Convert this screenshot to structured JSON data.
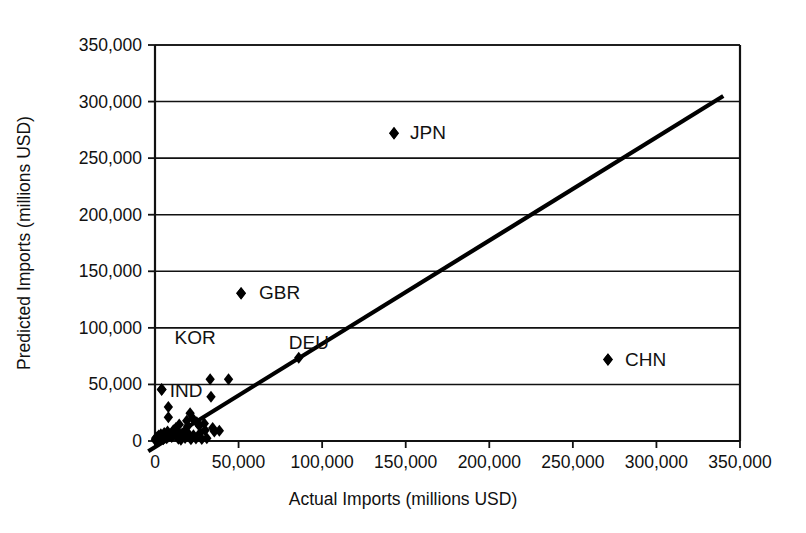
{
  "chart_data": {
    "type": "scatter",
    "title": "",
    "xlabel": "Actual Imports (millions USD)",
    "ylabel": "Predicted Imports (millions USD)",
    "xlim": [
      0,
      350000
    ],
    "ylim": [
      0,
      350000
    ],
    "xticks": [
      0,
      50000,
      100000,
      150000,
      200000,
      250000,
      300000,
      350000
    ],
    "yticks": [
      0,
      50000,
      100000,
      150000,
      200000,
      250000,
      300000,
      350000
    ],
    "xtick_labels": [
      "0",
      "50,000",
      "100,000",
      "150,000",
      "200,000",
      "250,000",
      "300,000",
      "350,000"
    ],
    "ytick_labels": [
      "0",
      "50,000",
      "100,000",
      "150,000",
      "200,000",
      "250,000",
      "300,000",
      "350,000"
    ],
    "grid": "horizontal",
    "legend": "none",
    "marker": "diamond",
    "marker_color": "#000000",
    "line_color": "#000000",
    "reference_line": {
      "name": "identity-line",
      "x": [
        -4000,
        340000
      ],
      "y": [
        -9000,
        305000
      ]
    },
    "annotations": [
      {
        "label": "JPN",
        "x": 143000,
        "y": 272000,
        "marker": true,
        "label_dx": 16,
        "label_dy": 6
      },
      {
        "label": "GBR",
        "x": 51500,
        "y": 130500,
        "marker": true,
        "label_dx": 18,
        "label_dy": 6
      },
      {
        "label": "CHN",
        "x": 271000,
        "y": 72000,
        "marker": true,
        "label_dx": 17,
        "label_dy": 6
      },
      {
        "label": "KOR",
        "x": 36000,
        "y": 86000,
        "marker": false,
        "label_dx": -20,
        "label_dy": 0
      },
      {
        "label": "DEU",
        "x": 104000,
        "y": 81000,
        "marker": false,
        "label_dx": -20,
        "label_dy": 0
      },
      {
        "label": "IND",
        "x": 4000,
        "y": 45500,
        "marker": true,
        "label_dx": 8,
        "label_dy": 7
      }
    ],
    "points": [
      {
        "x": 143000,
        "y": 272000
      },
      {
        "x": 51500,
        "y": 130500
      },
      {
        "x": 271000,
        "y": 72000
      },
      {
        "x": 86000,
        "y": 73500
      },
      {
        "x": 4000,
        "y": 45500
      },
      {
        "x": 33000,
        "y": 54500
      },
      {
        "x": 44000,
        "y": 54500
      },
      {
        "x": 33500,
        "y": 39000
      },
      {
        "x": 8000,
        "y": 30000
      },
      {
        "x": 8000,
        "y": 21000
      },
      {
        "x": 21000,
        "y": 24500
      },
      {
        "x": 19000,
        "y": 18000
      },
      {
        "x": 14500,
        "y": 14500
      },
      {
        "x": 25000,
        "y": 16500
      },
      {
        "x": 30000,
        "y": 9500
      },
      {
        "x": 34500,
        "y": 11500
      },
      {
        "x": 35500,
        "y": 8500
      },
      {
        "x": 38500,
        "y": 9000
      },
      {
        "x": 27000,
        "y": 7000
      },
      {
        "x": 23000,
        "y": 5000
      },
      {
        "x": 20000,
        "y": 6500
      },
      {
        "x": 17500,
        "y": 7500
      },
      {
        "x": 16000,
        "y": 4500
      },
      {
        "x": 13500,
        "y": 8000
      },
      {
        "x": 12000,
        "y": 5500
      },
      {
        "x": 11000,
        "y": 9500
      },
      {
        "x": 10000,
        "y": 3500
      },
      {
        "x": 9000,
        "y": 6000
      },
      {
        "x": 8000,
        "y": 4000
      },
      {
        "x": 7500,
        "y": 8500
      },
      {
        "x": 7000,
        "y": 2500
      },
      {
        "x": 6500,
        "y": 5500
      },
      {
        "x": 6000,
        "y": 3000
      },
      {
        "x": 5500,
        "y": 7000
      },
      {
        "x": 5000,
        "y": 1500
      },
      {
        "x": 4500,
        "y": 4500
      },
      {
        "x": 4000,
        "y": 2500
      },
      {
        "x": 3500,
        "y": 6000
      },
      {
        "x": 3000,
        "y": 1000
      },
      {
        "x": 2800,
        "y": 3500
      },
      {
        "x": 2500,
        "y": 2000
      },
      {
        "x": 2200,
        "y": 4800
      },
      {
        "x": 2000,
        "y": 800
      },
      {
        "x": 1800,
        "y": 2800
      },
      {
        "x": 1500,
        "y": 1600
      },
      {
        "x": 1300,
        "y": 3600
      },
      {
        "x": 1100,
        "y": 600
      },
      {
        "x": 900,
        "y": 2200
      },
      {
        "x": 700,
        "y": 1200
      },
      {
        "x": 500,
        "y": 2600
      },
      {
        "x": 400,
        "y": 400
      },
      {
        "x": 300,
        "y": 1600
      },
      {
        "x": 14000,
        "y": 2000
      },
      {
        "x": 15500,
        "y": 1200
      },
      {
        "x": 18000,
        "y": 2600
      },
      {
        "x": 21500,
        "y": 1500
      },
      {
        "x": 24500,
        "y": 2200
      },
      {
        "x": 28000,
        "y": 1800
      },
      {
        "x": 31000,
        "y": 2400
      },
      {
        "x": 12500,
        "y": 11500
      },
      {
        "x": 19500,
        "y": 13000
      },
      {
        "x": 22500,
        "y": 20000
      },
      {
        "x": 26500,
        "y": 13500
      },
      {
        "x": 29500,
        "y": 15500
      }
    ]
  }
}
